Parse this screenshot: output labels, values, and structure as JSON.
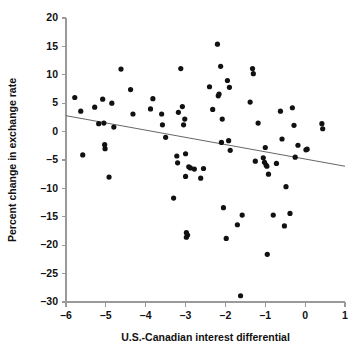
{
  "chart_data": {
    "type": "scatter",
    "title": "",
    "xlabel": "U.S.-Canadian interest differential",
    "ylabel": "Percent change in exchange rate",
    "xlim": [
      -6,
      1
    ],
    "ylim": [
      -30,
      20
    ],
    "xticks": [
      -6,
      -5,
      -4,
      -3,
      -2,
      -1,
      0,
      1
    ],
    "xtick_labels": [
      "–6",
      "–5",
      "–4",
      "–3",
      "–2",
      "–1",
      "0",
      "1"
    ],
    "yticks": [
      20,
      15,
      10,
      5,
      0,
      -5,
      -10,
      -15,
      -20,
      -25,
      -30
    ],
    "ytick_labels": [
      "20",
      "15",
      "10",
      "5",
      "0",
      "–5",
      "–10",
      "–15",
      "–20",
      "–25",
      "–30"
    ],
    "grid": false,
    "legend": null,
    "marker_color": "#111111",
    "axis_color": "#9a9a9a",
    "trend_line": {
      "x": [
        -6,
        1
      ],
      "y": [
        2.8,
        -6.1
      ],
      "color": "#555555",
      "label": "least-squares regression line"
    },
    "points": [
      [
        -5.78,
        6.0
      ],
      [
        -5.63,
        3.6
      ],
      [
        -5.58,
        -4.1
      ],
      [
        -5.28,
        4.3
      ],
      [
        -5.18,
        1.4
      ],
      [
        -5.08,
        5.7
      ],
      [
        -5.05,
        1.5
      ],
      [
        -5.03,
        -2.3
      ],
      [
        -5.02,
        -3.0
      ],
      [
        -4.92,
        -8.0
      ],
      [
        -4.85,
        5.0
      ],
      [
        -4.8,
        0.8
      ],
      [
        -4.62,
        11.0
      ],
      [
        -4.38,
        7.4
      ],
      [
        -4.32,
        3.1
      ],
      [
        -3.88,
        4.0
      ],
      [
        -3.82,
        5.8
      ],
      [
        -3.6,
        3.1
      ],
      [
        -3.58,
        1.2
      ],
      [
        -3.5,
        -1.0
      ],
      [
        -3.3,
        -11.7
      ],
      [
        -3.22,
        -4.3
      ],
      [
        -3.2,
        -5.5
      ],
      [
        -3.18,
        3.4
      ],
      [
        -3.12,
        11.1
      ],
      [
        -3.08,
        4.4
      ],
      [
        -3.05,
        1.2
      ],
      [
        -3.02,
        2.2
      ],
      [
        -3.0,
        -3.9
      ],
      [
        -3.0,
        -7.9
      ],
      [
        -2.98,
        -17.8
      ],
      [
        -2.98,
        -18.6
      ],
      [
        -2.95,
        -18.2
      ],
      [
        -2.92,
        -6.2
      ],
      [
        -2.88,
        -6.4
      ],
      [
        -2.78,
        -6.6
      ],
      [
        -2.62,
        -8.2
      ],
      [
        -2.55,
        -6.5
      ],
      [
        -2.4,
        7.9
      ],
      [
        -2.32,
        3.9
      ],
      [
        -2.2,
        15.4
      ],
      [
        -2.18,
        6.3
      ],
      [
        -2.16,
        6.6
      ],
      [
        -2.12,
        11.5
      ],
      [
        -2.1,
        -1.9
      ],
      [
        -2.08,
        2.2
      ],
      [
        -2.05,
        -13.4
      ],
      [
        -1.98,
        -18.8
      ],
      [
        -1.95,
        9.0
      ],
      [
        -1.92,
        -1.6
      ],
      [
        -1.9,
        7.8
      ],
      [
        -1.88,
        -3.3
      ],
      [
        -1.7,
        -16.4
      ],
      [
        -1.62,
        -28.9
      ],
      [
        -1.58,
        -14.7
      ],
      [
        -1.38,
        5.2
      ],
      [
        -1.32,
        11.1
      ],
      [
        -1.3,
        10.2
      ],
      [
        -1.25,
        -5.2
      ],
      [
        -1.18,
        1.5
      ],
      [
        -1.05,
        -4.6
      ],
      [
        -1.02,
        -5.4
      ],
      [
        -1.0,
        -2.8
      ],
      [
        -0.98,
        -5.9
      ],
      [
        -0.96,
        -6.1
      ],
      [
        -0.95,
        -21.6
      ],
      [
        -0.92,
        -7.5
      ],
      [
        -0.8,
        -14.7
      ],
      [
        -0.72,
        -5.6
      ],
      [
        -0.62,
        3.6
      ],
      [
        -0.58,
        -1.3
      ],
      [
        -0.52,
        -16.6
      ],
      [
        -0.48,
        -9.7
      ],
      [
        -0.38,
        -14.4
      ],
      [
        -0.32,
        4.2
      ],
      [
        -0.28,
        1.1
      ],
      [
        -0.25,
        -4.5
      ],
      [
        -0.18,
        -2.4
      ],
      [
        0.02,
        -3.2
      ],
      [
        0.05,
        -3.1
      ],
      [
        0.42,
        1.4
      ],
      [
        0.44,
        0.5
      ]
    ]
  }
}
